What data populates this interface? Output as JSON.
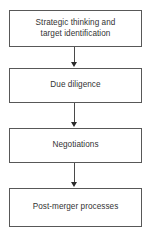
{
  "diagram": {
    "type": "flowchart",
    "orientation": "vertical",
    "title": "",
    "colors": {
      "background": "#ffffff",
      "node_fill": "#ffffff",
      "node_border": "#585858",
      "text": "#333333",
      "arrow": "#2b2b2b"
    },
    "nodes": [
      {
        "id": "step-1",
        "label": "Strategic thinking and\ntarget identification"
      },
      {
        "id": "step-2",
        "label": "Due diligence"
      },
      {
        "id": "step-3",
        "label": "Negotiations"
      },
      {
        "id": "step-4",
        "label": "Post-merger processes"
      }
    ],
    "connectors": [
      {
        "id": "arrow-1",
        "from": "step-1",
        "to": "step-2",
        "style": "solid-arrow-down"
      },
      {
        "id": "arrow-2",
        "from": "step-2",
        "to": "step-3",
        "style": "solid-arrow-down"
      },
      {
        "id": "arrow-3",
        "from": "step-3",
        "to": "step-4",
        "style": "solid-arrow-down"
      }
    ]
  }
}
